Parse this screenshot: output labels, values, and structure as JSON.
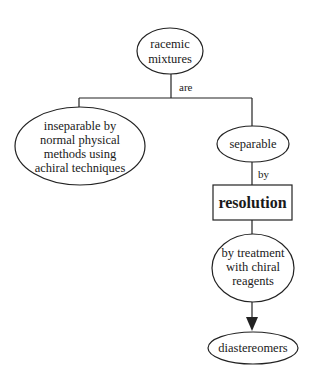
{
  "diagram": {
    "type": "concept-map",
    "nodes": {
      "racemic": {
        "shape": "ellipse",
        "lines": [
          "racemic",
          "mixtures"
        ]
      },
      "inseparable": {
        "shape": "ellipse",
        "lines": [
          "inseparable by",
          "normal physical",
          "methods using",
          "achiral techniques"
        ]
      },
      "separable": {
        "shape": "ellipse",
        "lines": [
          "separable"
        ]
      },
      "resolution": {
        "shape": "rectangle",
        "lines": [
          "resolution"
        ]
      },
      "chiral": {
        "shape": "ellipse",
        "lines": [
          "by treatment",
          "with chiral",
          "reagents"
        ]
      },
      "diastereomers": {
        "shape": "ellipse",
        "lines": [
          "diastereomers"
        ]
      }
    },
    "edges": {
      "racemic_to_branches": {
        "label": "are"
      },
      "separable_to_resolution": {
        "label": "by"
      },
      "resolution_to_chiral": {
        "label": ""
      },
      "chiral_to_diastereomers": {
        "label": "",
        "arrow": true
      }
    },
    "colors": {
      "stroke": "#222222",
      "text": "#1a1a1a",
      "background": "#ffffff"
    }
  }
}
